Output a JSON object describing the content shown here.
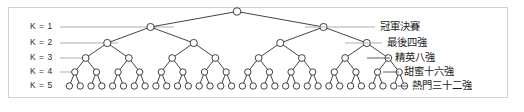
{
  "figure": {
    "frame": {
      "border_color": "#d2d2d2",
      "background": "#ffffff"
    },
    "node_color": "#ffffff",
    "node_stroke": "#222222",
    "edge_color": "#222222",
    "leader_color": "#999999"
  },
  "depth_labels": [
    {
      "text": "K = 1",
      "level": 1
    },
    {
      "text": "K = 2",
      "level": 2
    },
    {
      "text": "K = 3",
      "level": 3
    },
    {
      "text": "K = 4",
      "level": 4
    },
    {
      "text": "K = 5",
      "level": 5
    }
  ],
  "round_labels": [
    {
      "text": "冠軍決賽",
      "level": 1,
      "teams": 2
    },
    {
      "text": "最後四強",
      "level": 2,
      "teams": 4
    },
    {
      "text": "精英八強",
      "level": 3,
      "teams": 8
    },
    {
      "text": "甜蜜十六強",
      "level": 4,
      "teams": 16
    },
    {
      "text": "熱門三十二強",
      "level": 5,
      "teams": 32
    }
  ],
  "chart_data": {
    "type": "diagram",
    "subtype": "binary-tree",
    "title": "",
    "root_count": 1,
    "levels": [
      {
        "k": 1,
        "node_count": 2,
        "k_label": "K = 1",
        "round_label": "冠軍決賽"
      },
      {
        "k": 2,
        "node_count": 4,
        "k_label": "K = 2",
        "round_label": "最後四強"
      },
      {
        "k": 3,
        "node_count": 8,
        "k_label": "K = 3",
        "round_label": "精英八強"
      },
      {
        "k": 4,
        "node_count": 16,
        "k_label": "K = 4",
        "round_label": "甜蜜十六強"
      },
      {
        "k": 5,
        "node_count": 32,
        "k_label": "K = 5",
        "round_label": "熱門三十二強"
      }
    ]
  }
}
